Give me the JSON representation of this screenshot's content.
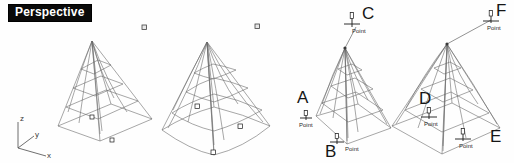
{
  "viewport": {
    "label": "Perspective",
    "background_color": "#fefefe",
    "label_bg_color": "#0a0a0a",
    "label_text_color": "#ffffff",
    "wire_color": "#6b6b6b",
    "marker_color": "#1a1a1a"
  },
  "axis_gizmo": {
    "name": "axis-indicator",
    "z_label": "z",
    "y_label": "y",
    "x_label": "x"
  },
  "objects": [
    {
      "id": "pyramid-1",
      "caption": ""
    },
    {
      "id": "pyramid-2",
      "caption": ""
    },
    {
      "id": "pyramid-3",
      "caption": ""
    },
    {
      "id": "pyramid-4",
      "caption": ""
    }
  ],
  "control_points": [
    {
      "id": "cp-top-1",
      "label": "",
      "caption": ""
    },
    {
      "id": "cp-top-2",
      "label": "",
      "caption": ""
    }
  ],
  "point_annotations": [
    {
      "key": "A",
      "label": "A",
      "caption": "Point"
    },
    {
      "key": "B",
      "label": "B",
      "caption": "Point"
    },
    {
      "key": "C",
      "label": "C",
      "caption": "Point"
    },
    {
      "key": "D",
      "label": "D",
      "caption": "Point"
    },
    {
      "key": "E",
      "label": "E",
      "caption": "Point"
    },
    {
      "key": "F",
      "label": "F",
      "caption": "Point"
    }
  ]
}
